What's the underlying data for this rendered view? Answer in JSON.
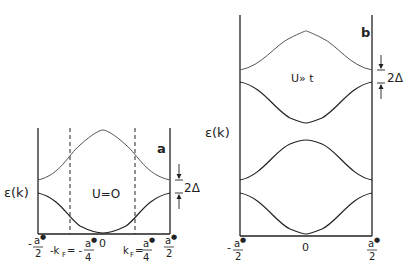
{
  "panel_a": {
    "tag": "a",
    "ylabel": "ε(k)",
    "annotation": "U=O",
    "gap_label": "2Δ",
    "x_ticks": {
      "left": {
        "sign": "-",
        "num": "a*",
        "den": "2"
      },
      "neg_kf": {
        "prefix": "-k",
        "sub": "F",
        "eq": "= -",
        "num": "a*",
        "den": "4"
      },
      "zero": "0",
      "pos_kf": {
        "prefix": "k",
        "sub": "F",
        "eq": "=",
        "num": "a*",
        "den": "4"
      },
      "right": {
        "num": "a*",
        "den": "2"
      }
    }
  },
  "panel_b": {
    "tag": "b",
    "ylabel": "ε(k)",
    "annotation": "U» t",
    "gap_label": "2Δ",
    "x_ticks": {
      "left": {
        "sign": "-",
        "num": "a*",
        "den": "2"
      },
      "zero": "0",
      "right": {
        "num": "a*",
        "den": "2"
      }
    }
  }
}
